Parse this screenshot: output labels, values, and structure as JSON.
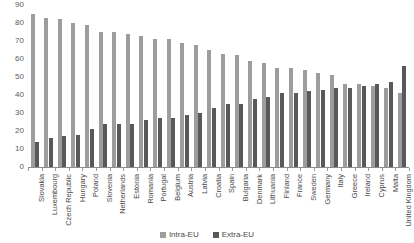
{
  "chart_data": {
    "type": "bar",
    "title": "",
    "subtitle": "",
    "xlabel": "",
    "ylabel": "",
    "ylim": [
      0,
      90
    ],
    "yticks": [
      0,
      10,
      20,
      30,
      40,
      50,
      60,
      70,
      80,
      90
    ],
    "grid": false,
    "legend_position": "bottom",
    "categories": [
      "Slovakia",
      "Luxembourg",
      "Czech Republic",
      "Hungary",
      "Poland",
      "Slovenia",
      "Netherlands",
      "Estonia",
      "Romania",
      "Portugal",
      "Belgium",
      "Austria",
      "Latvia",
      "Croatia",
      "Spain",
      "Bulgaria",
      "Denmark",
      "Lithuania",
      "Finland",
      "France",
      "Sweden",
      "Germany",
      "Italy",
      "Greece",
      "Ireland",
      "Cyprus",
      "Malta",
      "United Kingdom"
    ],
    "series": [
      {
        "name": "Intra-EU",
        "color": "#9d9d9d",
        "values": [
          85,
          83,
          82,
          80,
          79,
          75,
          75,
          74,
          73,
          71,
          71,
          69,
          68,
          65,
          63,
          62,
          59,
          58,
          55,
          55,
          54,
          52,
          51,
          46,
          46,
          45,
          44,
          41
        ]
      },
      {
        "name": "Extra-EU",
        "color": "#595959",
        "values": [
          14,
          16,
          17,
          18,
          21,
          24,
          24,
          24,
          26,
          27,
          27,
          29,
          30,
          33,
          35,
          35,
          38,
          39,
          41,
          41,
          42,
          43,
          44,
          44,
          45,
          46,
          47,
          56
        ]
      }
    ]
  },
  "legend": {
    "items": [
      {
        "label": "Intra-EU",
        "color": "#9d9d9d"
      },
      {
        "label": "Extra-EU",
        "color": "#595959"
      }
    ]
  }
}
